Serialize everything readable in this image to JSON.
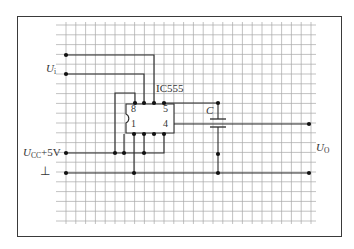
{
  "diagram": {
    "ic": {
      "label": "IC555",
      "pins_top": [
        "8",
        "5"
      ],
      "pins_bottom": [
        "1",
        "4"
      ]
    },
    "labels": {
      "input": "U",
      "input_sub": "i",
      "vcc": "U",
      "vcc_sub": "CC",
      "vcc_value": "+5V",
      "ground": "⊥",
      "capacitor": "C",
      "output": "U",
      "output_sub": "O"
    },
    "colors": {
      "line": "#2a2a2a",
      "grid": "#9a9a9a",
      "frame": "#3a3a3a"
    }
  }
}
